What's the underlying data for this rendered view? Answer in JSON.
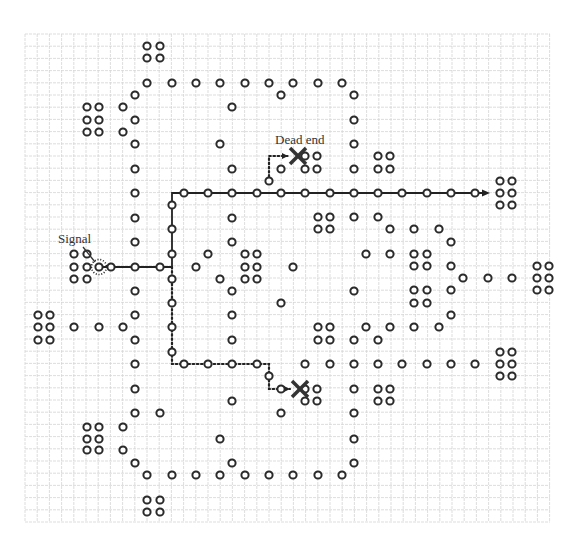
{
  "diagram": {
    "labels": {
      "signal": "Signal",
      "dead_end": "Dead end"
    },
    "colors": {
      "grid": "#d4d4d4",
      "circle": "#2a2a2a",
      "path": "#222222",
      "cross": "#333333",
      "background": "#ffffff"
    },
    "grid": {
      "x0": 25,
      "y0": 34,
      "x1": 550,
      "y1": 522,
      "step": 12.2
    },
    "signal_source": [
      99,
      267
    ],
    "dead_ends": [
      [
        298,
        156
      ],
      [
        300,
        389
      ]
    ],
    "successful_path": {
      "style": "solid",
      "points": [
        [
          99,
          267
        ],
        [
          172,
          267
        ],
        [
          172,
          193
        ],
        [
          486,
          193
        ]
      ],
      "arrow_end": [
        486,
        193
      ]
    },
    "failed_paths": [
      {
        "style": "dotted",
        "points": [
          [
            269,
            181
          ],
          [
            269,
            156
          ],
          [
            288,
            156
          ]
        ]
      },
      {
        "style": "dotted",
        "points": [
          [
            172,
            267
          ],
          [
            172,
            364
          ],
          [
            269,
            364
          ],
          [
            269,
            389
          ],
          [
            290,
            389
          ]
        ]
      }
    ],
    "cells": [
      [
        147,
        46
      ],
      [
        160,
        46
      ],
      [
        147,
        58
      ],
      [
        160,
        58
      ],
      [
        147,
        83
      ],
      [
        172,
        83
      ],
      [
        196,
        83
      ],
      [
        220,
        83
      ],
      [
        245,
        83
      ],
      [
        269,
        83
      ],
      [
        293,
        83
      ],
      [
        318,
        83
      ],
      [
        342,
        83
      ],
      [
        135,
        95
      ],
      [
        281,
        95
      ],
      [
        354,
        95
      ],
      [
        87,
        107
      ],
      [
        99,
        107
      ],
      [
        123,
        107
      ],
      [
        232,
        107
      ],
      [
        87,
        120
      ],
      [
        99,
        120
      ],
      [
        135,
        120
      ],
      [
        354,
        120
      ],
      [
        87,
        132
      ],
      [
        99,
        132
      ],
      [
        123,
        132
      ],
      [
        135,
        144
      ],
      [
        220,
        144
      ],
      [
        354,
        144
      ],
      [
        305,
        156
      ],
      [
        317,
        156
      ],
      [
        378,
        156
      ],
      [
        390,
        156
      ],
      [
        135,
        169
      ],
      [
        232,
        169
      ],
      [
        281,
        169
      ],
      [
        305,
        169
      ],
      [
        317,
        169
      ],
      [
        354,
        169
      ],
      [
        378,
        169
      ],
      [
        390,
        169
      ],
      [
        269,
        181
      ],
      [
        500,
        181
      ],
      [
        512,
        181
      ],
      [
        135,
        193
      ],
      [
        184,
        193
      ],
      [
        208,
        193
      ],
      [
        232,
        193
      ],
      [
        257,
        193
      ],
      [
        281,
        193
      ],
      [
        305,
        193
      ],
      [
        330,
        193
      ],
      [
        354,
        193
      ],
      [
        378,
        193
      ],
      [
        402,
        193
      ],
      [
        427,
        193
      ],
      [
        451,
        193
      ],
      [
        475,
        193
      ],
      [
        500,
        193
      ],
      [
        512,
        193
      ],
      [
        172,
        205
      ],
      [
        500,
        205
      ],
      [
        512,
        205
      ],
      [
        135,
        218
      ],
      [
        232,
        218
      ],
      [
        318,
        217
      ],
      [
        330,
        217
      ],
      [
        354,
        217
      ],
      [
        378,
        217
      ],
      [
        172,
        229
      ],
      [
        318,
        229
      ],
      [
        330,
        229
      ],
      [
        390,
        229
      ],
      [
        414,
        229
      ],
      [
        439,
        229
      ],
      [
        135,
        242
      ],
      [
        232,
        242
      ],
      [
        451,
        242
      ],
      [
        74,
        254
      ],
      [
        87,
        254
      ],
      [
        172,
        254
      ],
      [
        208,
        254
      ],
      [
        245,
        254
      ],
      [
        257,
        254
      ],
      [
        366,
        254
      ],
      [
        390,
        254
      ],
      [
        414,
        254
      ],
      [
        427,
        254
      ],
      [
        74,
        267
      ],
      [
        87,
        267
      ],
      [
        111,
        267
      ],
      [
        135,
        267
      ],
      [
        160,
        267
      ],
      [
        196,
        267
      ],
      [
        245,
        267
      ],
      [
        257,
        267
      ],
      [
        293,
        267
      ],
      [
        414,
        266
      ],
      [
        427,
        266
      ],
      [
        451,
        266
      ],
      [
        537,
        266
      ],
      [
        549,
        266
      ],
      [
        74,
        279
      ],
      [
        87,
        279
      ],
      [
        172,
        279
      ],
      [
        220,
        279
      ],
      [
        245,
        279
      ],
      [
        257,
        279
      ],
      [
        463,
        278
      ],
      [
        488,
        278
      ],
      [
        512,
        278
      ],
      [
        537,
        278
      ],
      [
        549,
        278
      ],
      [
        135,
        291
      ],
      [
        232,
        291
      ],
      [
        354,
        291
      ],
      [
        414,
        290
      ],
      [
        427,
        290
      ],
      [
        451,
        290
      ],
      [
        537,
        290
      ],
      [
        549,
        290
      ],
      [
        172,
        303
      ],
      [
        281,
        303
      ],
      [
        414,
        303
      ],
      [
        427,
        303
      ],
      [
        38,
        315
      ],
      [
        50,
        315
      ],
      [
        135,
        315
      ],
      [
        232,
        315
      ],
      [
        451,
        315
      ],
      [
        38,
        327
      ],
      [
        50,
        327
      ],
      [
        74,
        327
      ],
      [
        99,
        327
      ],
      [
        123,
        327
      ],
      [
        172,
        327
      ],
      [
        318,
        327
      ],
      [
        330,
        327
      ],
      [
        366,
        327
      ],
      [
        390,
        327
      ],
      [
        414,
        327
      ],
      [
        439,
        327
      ],
      [
        38,
        340
      ],
      [
        50,
        340
      ],
      [
        135,
        340
      ],
      [
        232,
        340
      ],
      [
        318,
        340
      ],
      [
        330,
        340
      ],
      [
        354,
        340
      ],
      [
        378,
        340
      ],
      [
        172,
        352
      ],
      [
        500,
        352
      ],
      [
        512,
        352
      ],
      [
        135,
        364
      ],
      [
        184,
        364
      ],
      [
        208,
        364
      ],
      [
        232,
        364
      ],
      [
        257,
        364
      ],
      [
        305,
        364
      ],
      [
        330,
        364
      ],
      [
        354,
        364
      ],
      [
        378,
        364
      ],
      [
        402,
        364
      ],
      [
        427,
        364
      ],
      [
        451,
        364
      ],
      [
        475,
        364
      ],
      [
        500,
        364
      ],
      [
        512,
        364
      ],
      [
        269,
        376
      ],
      [
        500,
        376
      ],
      [
        512,
        376
      ],
      [
        135,
        389
      ],
      [
        281,
        389
      ],
      [
        305,
        389
      ],
      [
        317,
        389
      ],
      [
        354,
        389
      ],
      [
        378,
        389
      ],
      [
        390,
        389
      ],
      [
        232,
        401
      ],
      [
        305,
        401
      ],
      [
        317,
        401
      ],
      [
        378,
        401
      ],
      [
        390,
        401
      ],
      [
        135,
        413
      ],
      [
        160,
        413
      ],
      [
        281,
        413
      ],
      [
        354,
        413
      ],
      [
        87,
        427
      ],
      [
        99,
        427
      ],
      [
        123,
        427
      ],
      [
        87,
        439
      ],
      [
        99,
        439
      ],
      [
        220,
        439
      ],
      [
        354,
        439
      ],
      [
        87,
        450
      ],
      [
        99,
        450
      ],
      [
        123,
        450
      ],
      [
        135,
        463
      ],
      [
        232,
        463
      ],
      [
        354,
        463
      ],
      [
        147,
        475
      ],
      [
        172,
        475
      ],
      [
        196,
        475
      ],
      [
        220,
        475
      ],
      [
        245,
        475
      ],
      [
        269,
        475
      ],
      [
        293,
        475
      ],
      [
        318,
        475
      ],
      [
        342,
        475
      ],
      [
        147,
        500
      ],
      [
        160,
        500
      ],
      [
        147,
        512
      ],
      [
        160,
        512
      ]
    ]
  }
}
